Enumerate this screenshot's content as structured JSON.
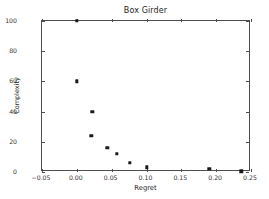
{
  "chart_data": {
    "type": "scatter",
    "title": "Box Girder",
    "xlabel": "Regret",
    "ylabel": "Complexity",
    "xlim": [
      -0.05,
      0.25
    ],
    "ylim": [
      0,
      100
    ],
    "xticks": [
      -0.05,
      0.0,
      0.05,
      0.1,
      0.15,
      0.2,
      0.25
    ],
    "xticklabels": [
      "−0.05",
      "0.00",
      "0.05",
      "0.10",
      "0.15",
      "0.20",
      "0.25"
    ],
    "yticks": [
      0,
      20,
      40,
      60,
      80,
      100
    ],
    "yticklabels": [
      "0",
      "20",
      "40",
      "60",
      "80",
      "100"
    ],
    "grid": false,
    "legend": null,
    "marker": "square",
    "marker_color": "#1a1a1a",
    "series": [
      {
        "name": "Box Girder",
        "points": [
          {
            "x": 0.0,
            "y": 100
          },
          {
            "x": 0.0,
            "y": 60
          },
          {
            "x": 0.022,
            "y": 40
          },
          {
            "x": 0.021,
            "y": 24
          },
          {
            "x": 0.044,
            "y": 16
          },
          {
            "x": 0.057,
            "y": 12
          },
          {
            "x": 0.076,
            "y": 6
          },
          {
            "x": 0.1,
            "y": 3
          },
          {
            "x": 0.19,
            "y": 2
          },
          {
            "x": 0.236,
            "y": 0.5
          }
        ]
      }
    ]
  },
  "figure": {
    "background": "#ffffff",
    "axes_color": "#4d4d4d",
    "text_color": "#262626"
  }
}
